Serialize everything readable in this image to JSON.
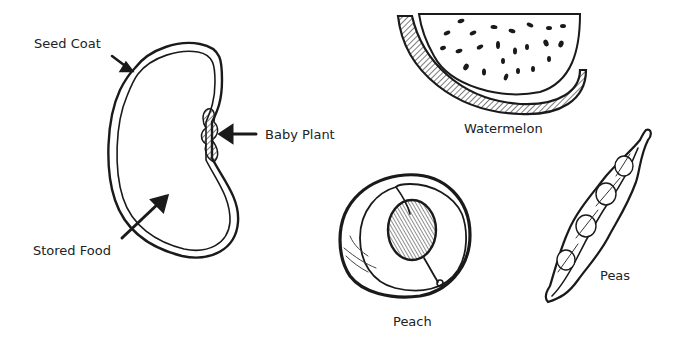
{
  "diagram": {
    "seed": {
      "labels": {
        "seed_coat": "Seed Coat",
        "baby_plant": "Baby Plant",
        "stored_food": "Stored Food"
      }
    },
    "examples": {
      "watermelon": "Watermelon",
      "peach": "Peach",
      "peas": "Peas"
    },
    "colors": {
      "ink": "#1a1a1a",
      "background": "#ffffff"
    }
  }
}
